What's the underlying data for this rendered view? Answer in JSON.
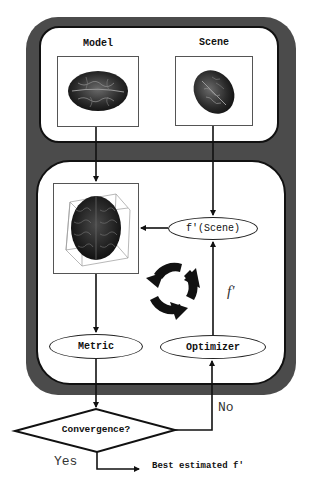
{
  "diagram": {
    "type": "flowchart",
    "top_panel": {
      "model_label": "Model",
      "scene_label": "Scene"
    },
    "loop_panel": {
      "transform_node": "f'(Scene)",
      "metric_node": "Metric",
      "optimizer_node": "Optimizer",
      "parameter_label": "f'",
      "cycle_icon": "circular-arrows-icon"
    },
    "decision": {
      "label": "Convergence?",
      "no_label": "No",
      "yes_label": "Yes"
    },
    "output": {
      "label": "Best estimated f'"
    },
    "colors": {
      "frame": "#4b4b4b",
      "panel": "#ffffff",
      "stroke": "#111111"
    }
  }
}
